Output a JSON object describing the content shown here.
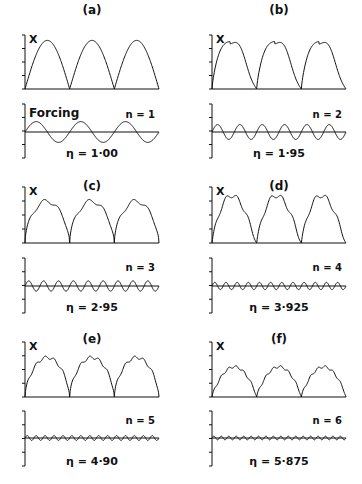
{
  "chart_data": {
    "type": "line",
    "panels": [
      {
        "label": "(a)",
        "ylabel": "X",
        "forcing_label": "Forcing",
        "n_label": "n = 1",
        "n": 1,
        "eta_label": "η = 1·00",
        "eta": 1.0,
        "response_shape": "arch",
        "cycles": 3,
        "forcing_amplitude": 0.35
      },
      {
        "label": "(b)",
        "ylabel": "X",
        "forcing_label": "",
        "n_label": "n = 2",
        "n": 2,
        "eta_label": "η = 1·95",
        "eta": 1.95,
        "response_shape": "skewed-shoulder",
        "cycles": 3,
        "forcing_amplitude": 0.25
      },
      {
        "label": "(c)",
        "ylabel": "X",
        "forcing_label": "",
        "n_label": "n = 3",
        "n": 3,
        "eta_label": "η = 2·95",
        "eta": 2.95,
        "response_shape": "flat-top",
        "cycles": 3,
        "forcing_amplitude": 0.17
      },
      {
        "label": "(d)",
        "ylabel": "X",
        "forcing_label": "",
        "n_label": "n = 4",
        "n": 4,
        "eta_label": "η = 3·925",
        "eta": 3.925,
        "response_shape": "peaked-ripple",
        "cycles": 3,
        "forcing_amplitude": 0.12
      },
      {
        "label": "(e)",
        "ylabel": "X",
        "forcing_label": "",
        "n_label": "n = 5",
        "n": 5,
        "eta_label": "η = 4·90",
        "eta": 4.9,
        "response_shape": "flat-top-ripple",
        "cycles": 3,
        "forcing_amplitude": 0.08
      },
      {
        "label": "(f)",
        "ylabel": "X",
        "forcing_label": "",
        "n_label": "n = 6",
        "n": 6,
        "eta_label": "η = 5·875",
        "eta": 5.875,
        "response_shape": "low-arch-ripple",
        "cycles": 3,
        "forcing_amplitude": 0.06
      }
    ],
    "upper_peak_relative": [
      0.9,
      0.9,
      0.75,
      0.85,
      0.72,
      0.55
    ],
    "axis_ticks": 4,
    "grid": false,
    "legend": "none"
  }
}
